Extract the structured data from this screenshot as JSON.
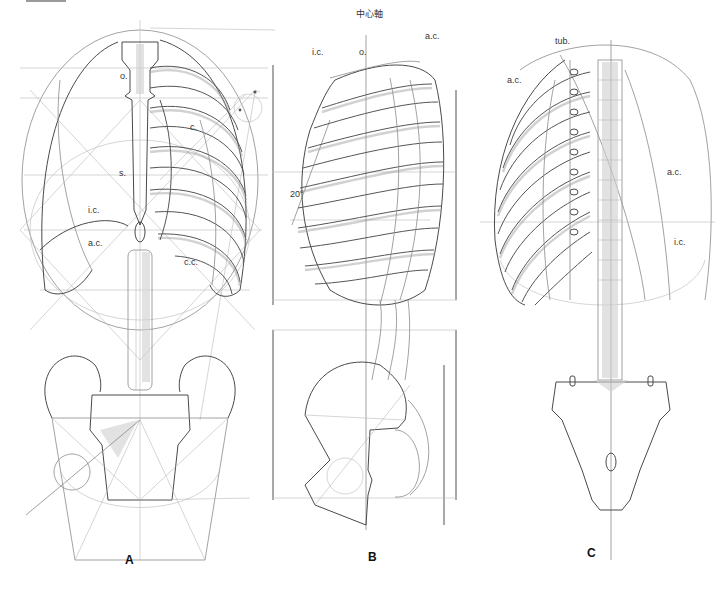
{
  "figure": {
    "views": [
      {
        "id": "A",
        "caption": "A",
        "view": "front",
        "labels": {
          "o": "o.",
          "c": "c.",
          "s": "s.",
          "ic": "i.c.",
          "ac": "a.c.",
          "cc": "c.c."
        }
      },
      {
        "id": "B",
        "caption": "B",
        "view": "side",
        "labels": {
          "axis": "中心軸",
          "ac": "a.c.",
          "ic": "i.c.",
          "o": "o.",
          "angle": "20°"
        }
      },
      {
        "id": "C",
        "caption": "C",
        "view": "back",
        "labels": {
          "tub": "tub.",
          "ac_left": "a.c.",
          "ac_right": "a.c.",
          "ic": "i.c."
        }
      }
    ],
    "colors": {
      "ink_dark": "#4a4a4a",
      "ink_mid": "#8a8a8a",
      "ink_light": "#b9b9b9",
      "paper": "#ffffff"
    }
  }
}
